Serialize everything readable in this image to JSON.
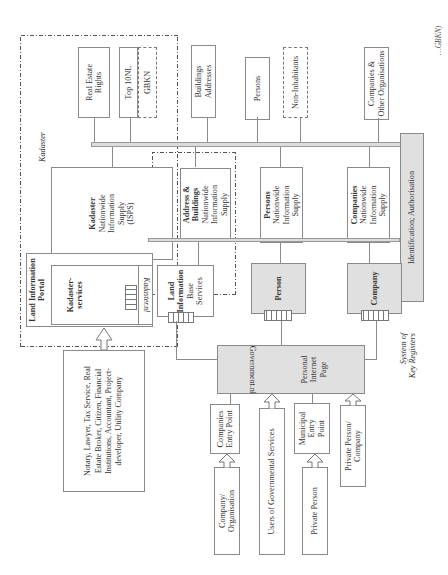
{
  "diagram": {
    "orientation": "rotated -90 degrees (text reads bottom-to-top)",
    "regions": {
      "kadaster": "Kadaster",
      "system_of_key_registers_line1": "System of",
      "system_of_key_registers_line2": "Key Registers"
    },
    "registers": {
      "real_estate_rights": [
        "Real Estate",
        "Rights"
      ],
      "top10nl": "Top 10NL",
      "gbkn": "GBKN",
      "buildings_addresses": [
        "Buildings",
        "Addresses"
      ],
      "persons": "Persons",
      "non_inhabitants": "Non-Inhabitants",
      "companies_other": [
        "Companies &",
        "Other Organisations"
      ]
    },
    "identification": "Identification; Authorisation",
    "supplies": {
      "kadaster": {
        "title": "Kadaster",
        "lines": [
          "Nationwide",
          "Information",
          "Supply",
          "(ISPS)"
        ]
      },
      "address_buildings": {
        "title1": "Address &",
        "title2": "Buildings",
        "lines": [
          "Nationwide",
          "Information",
          "Supply"
        ]
      },
      "persons": {
        "title": "Persons",
        "lines": [
          "Nationwide",
          "Information",
          "Supply"
        ]
      },
      "companies": {
        "title": "Companies",
        "lines": [
          "Nationwide",
          "Information",
          "Supply"
        ]
      }
    },
    "portal": {
      "title1": "Land Information",
      "title2": "Portal",
      "kadaster_services1": "Kadaster-",
      "kadaster_services2": "services",
      "kadaster_nl": "Kadaster.nl"
    },
    "land_info_base": {
      "title1": "Land",
      "title2": "Information",
      "line1": "Base",
      "line2": "Services"
    },
    "person": "Person",
    "company": "Company",
    "government": {
      "name": "Government.nl",
      "personal1": "Personal",
      "personal2": "Internet",
      "personal3": "Page"
    },
    "notary": "Notary, Lawyer, Tax Service, Real Estate Broker, Citizen, Financial Institutions, Accountant, Project-developer, Utility Company",
    "entry_points": {
      "companies": [
        "Companies",
        "Entry Point"
      ],
      "users_gov": "Users of Governmental Services",
      "municipal": [
        "Municipal",
        "Entry",
        "Point"
      ],
      "private_person_company": [
        "Private Person/",
        "Company"
      ],
      "company_org": [
        "Company/",
        "Organisation"
      ],
      "private_person": "Private Person"
    },
    "caption_fragment": "…GBKN)"
  }
}
